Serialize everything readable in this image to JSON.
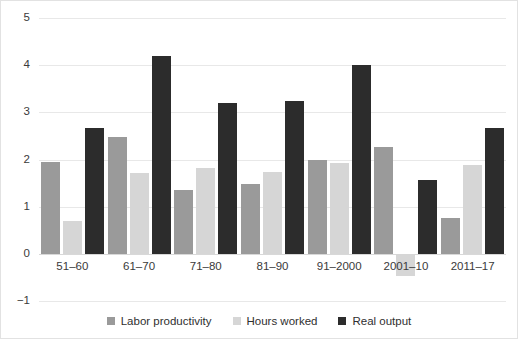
{
  "chart_data": {
    "type": "bar",
    "title": "",
    "subtitle": "",
    "xlabel": "",
    "ylabel": "",
    "ylim": [
      -1,
      5
    ],
    "yticks": [
      5,
      4,
      3,
      2,
      1,
      0,
      -1
    ],
    "ytick_labels": [
      "5",
      "4",
      "3",
      "2",
      "1",
      "0",
      "−1"
    ],
    "grid": true,
    "legend_position": "bottom-center",
    "categories": [
      "51–60",
      "61–70",
      "71–80",
      "81–90",
      "91–2000",
      "2001–10",
      "2011–17"
    ],
    "series": [
      {
        "name": "Labor productivity",
        "color": "#9a9a9a",
        "values": [
          1.95,
          2.47,
          1.35,
          1.48,
          2.0,
          2.27,
          0.76
        ]
      },
      {
        "name": "Hours worked",
        "color": "#d6d6d6",
        "values": [
          0.7,
          1.72,
          1.82,
          1.73,
          1.93,
          -0.47,
          1.88
        ]
      },
      {
        "name": "Real output",
        "color": "#2c2c2c",
        "values": [
          2.67,
          4.2,
          3.2,
          3.25,
          4.0,
          1.57,
          2.67
        ]
      }
    ]
  },
  "legend": {
    "items": [
      {
        "label": "Labor productivity",
        "color": "#9a9a9a"
      },
      {
        "label": "Hours worked",
        "color": "#d6d6d6"
      },
      {
        "label": "Real output",
        "color": "#2c2c2c"
      }
    ]
  }
}
